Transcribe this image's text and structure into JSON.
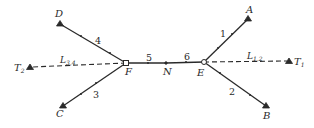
{
  "diagram": {
    "colors": {
      "line": "#2a2a2a",
      "background": "#ffffff"
    },
    "points": {
      "A": {
        "label": "A",
        "x": 248,
        "y": 19,
        "marker": "triangle"
      },
      "B": {
        "label": "B",
        "x": 266,
        "y": 106,
        "marker": "triangle"
      },
      "C": {
        "label": "C",
        "x": 63,
        "y": 106,
        "marker": "triangle"
      },
      "D": {
        "label": "D",
        "x": 60,
        "y": 24,
        "marker": "triangle"
      },
      "E": {
        "label": "E",
        "x": 204,
        "y": 62,
        "marker": "circle"
      },
      "F": {
        "label": "F",
        "x": 126,
        "y": 63,
        "marker": "square"
      },
      "N": {
        "label": "N",
        "x": 166,
        "y": 63,
        "marker": "dot"
      },
      "T1": {
        "label": "T",
        "sub": "1",
        "x": 289,
        "y": 61,
        "marker": "triangle"
      },
      "T2": {
        "label": "T",
        "sub": "2",
        "x": 30,
        "y": 67,
        "marker": "triangle"
      }
    },
    "segments": [
      {
        "id": "1",
        "from": "E",
        "to": "A",
        "label": "1",
        "style": "solid"
      },
      {
        "id": "2",
        "from": "E",
        "to": "B",
        "label": "2",
        "style": "solid"
      },
      {
        "id": "3",
        "from": "F",
        "to": "C",
        "label": "3",
        "style": "solid"
      },
      {
        "id": "4",
        "from": "F",
        "to": "D",
        "label": "4",
        "style": "solid"
      },
      {
        "id": "5",
        "from": "F",
        "to": "N",
        "label": "5",
        "style": "solid"
      },
      {
        "id": "6",
        "from": "N",
        "to": "E",
        "label": "6",
        "style": "solid"
      },
      {
        "id": "L12",
        "from": "E",
        "to": "T1",
        "label": "L",
        "sub": "1,2",
        "style": "dashed"
      },
      {
        "id": "L34",
        "from": "F",
        "to": "T2",
        "label": "L",
        "sub": "3,4",
        "style": "dashed"
      }
    ],
    "labels": {
      "A": "A",
      "B": "B",
      "C": "C",
      "D": "D",
      "E": "E",
      "F": "F",
      "N": "N",
      "T1_main": "T",
      "T1_sub": "1",
      "T2_main": "T",
      "T2_sub": "2",
      "seg1": "1",
      "seg2": "2",
      "seg3": "3",
      "seg4": "4",
      "seg5": "5",
      "seg6": "6",
      "L12_main": "L",
      "L12_sub": "1,2",
      "L34_main": "L",
      "L34_sub": "3,4"
    }
  }
}
